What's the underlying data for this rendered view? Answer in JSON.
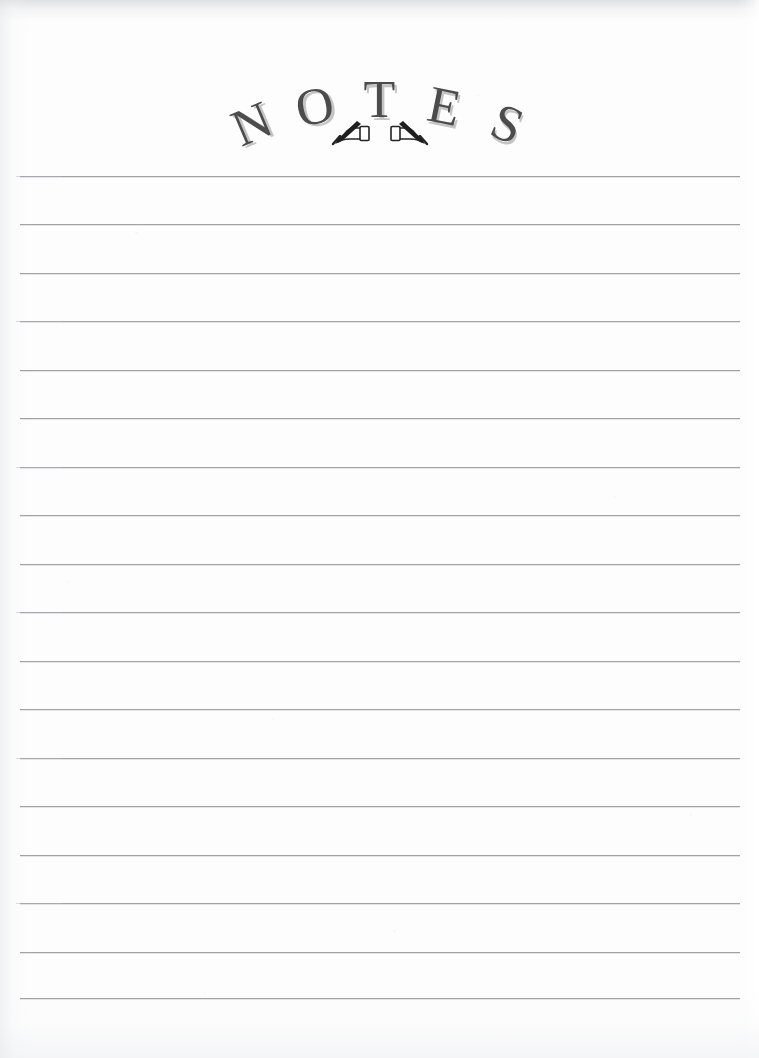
{
  "page": {
    "kind": "lined-notes-page",
    "width": 759,
    "height": 1058,
    "background_color": "#fdfdfd"
  },
  "header": {
    "title": "NOTES",
    "title_letters": [
      "N",
      "O",
      "T",
      "E",
      "S"
    ],
    "title_color": "#4c4c4c",
    "title_shadow_color": "#969696",
    "style": "arched serif capitals with drop shadow",
    "ornament": {
      "name": "hand-with-pen-pair",
      "count": 2,
      "description": "two mirrored hands holding pens",
      "color": "#2b2b2b"
    }
  },
  "ruled_area": {
    "line_color": "#9b9b9e",
    "line_count": 18,
    "line_left": 20,
    "line_right": 740,
    "first_line_y": 176,
    "line_spacing": 48.4,
    "line_ys": [
      176,
      224,
      273,
      321,
      370,
      418,
      467,
      515,
      564,
      612,
      661,
      709,
      758,
      806,
      855,
      903,
      952,
      998
    ],
    "content": ""
  }
}
